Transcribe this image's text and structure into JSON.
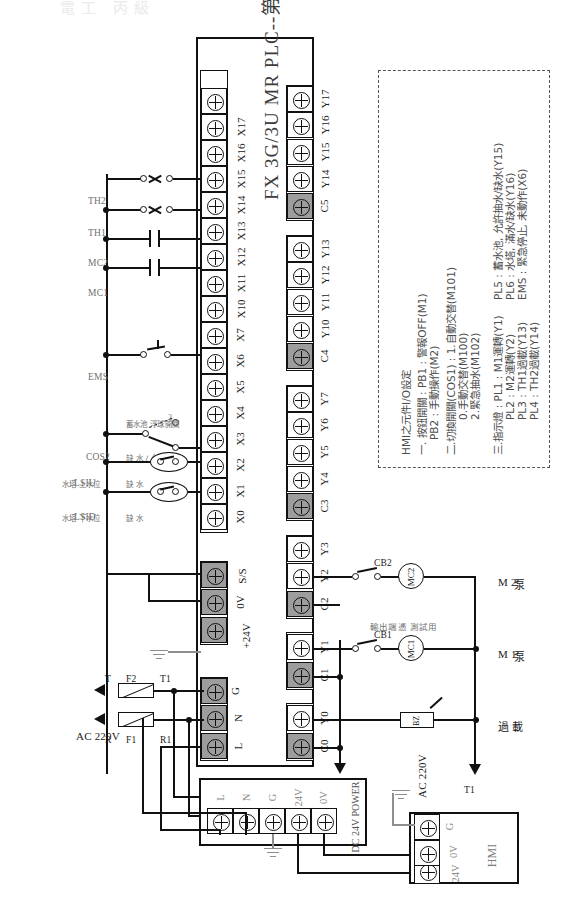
{
  "page": {
    "faint_header": "電工 丙級",
    "plc_title": "FX 3G/3U  MR  PLC--第二題"
  },
  "plc": {
    "input_terminal_labels": [
      "L",
      "N",
      "G",
      "+24V",
      "0V",
      "S/S",
      "X0",
      "X1",
      "X2",
      "X3",
      "X4",
      "X5",
      "X6",
      "X7",
      "X10",
      "X11",
      "X12",
      "X13",
      "X14",
      "X15",
      "X16",
      "X17"
    ],
    "output_terminal_labels": [
      "C0",
      "Y0",
      "C1",
      "Y1",
      "C2",
      "Y2",
      "Y3",
      "C3",
      "Y4",
      "Y5",
      "Y6",
      "Y7",
      "C4",
      "Y10",
      "Y11",
      "Y12",
      "Y13",
      "C5",
      "Y14",
      "Y15",
      "Y16",
      "Y17"
    ],
    "output_groups": [
      {
        "common": "C0",
        "outputs": [
          "Y0"
        ]
      },
      {
        "common": "C1",
        "outputs": [
          "Y1"
        ]
      },
      {
        "common": "C2",
        "outputs": [
          "Y2",
          "Y3"
        ]
      },
      {
        "common": "C3",
        "outputs": [
          "Y4",
          "Y5",
          "Y6",
          "Y7"
        ]
      },
      {
        "common": "C4",
        "outputs": [
          "Y10",
          "Y11",
          "Y12",
          "Y13"
        ]
      },
      {
        "common": "C5",
        "outputs": [
          "Y14",
          "Y15",
          "Y16",
          "Y17"
        ]
      }
    ]
  },
  "note_box": {
    "title": "HMI之元件I/O設定",
    "lines": [
      "一. 按鈕開關 : PB1 : 警報OFF(M1)",
      "PB2 : 手動操作(M2)",
      "二.切換開關(COS1) : 1.自動交替(M101)",
      "0.手動交替(M100)",
      "2.緊急抽水(M102)",
      "三.指示燈 :   PL1 : M1運轉(Y1)",
      "PL2 : M2運轉(Y2)",
      "PL3 : TH1過載(Y13)",
      "PL4 : TH2過載(Y14)",
      "PL5 : 蓄水池, 允許抽水/缺水(Y15)",
      "PL6 : 水塔, 滿水/缺水(Y16)",
      "EMS : 緊急停止, 未動作(X6)"
    ]
  },
  "inputs": {
    "devices": [
      {
        "name": "LSID",
        "desc_top": "水塔 下水位",
        "desc_bottom": "缺 水",
        "type": "float-switch"
      },
      {
        "name": "LSIU",
        "desc_top": "水塔 上水位",
        "desc_bottom": "缺 水",
        "type": "float-switch"
      },
      {
        "name": "COS2",
        "desc_top": "蓄水池 浮球開關",
        "desc_bottom": "缺 水 / 允許 抽水",
        "type": "selector",
        "positions": [
          "1",
          "2"
        ]
      },
      {
        "name": "EMS",
        "desc_top": "",
        "desc_bottom": "",
        "type": "emergency-stop"
      },
      {
        "name": "MC1",
        "desc_top": "",
        "desc_bottom": "",
        "type": "nc-contact"
      },
      {
        "name": "MC2",
        "desc_top": "",
        "desc_bottom": "",
        "type": "nc-contact"
      },
      {
        "name": "TH1",
        "desc_top": "",
        "desc_bottom": "",
        "type": "thermal-overload"
      },
      {
        "name": "TH2",
        "desc_top": "",
        "desc_bottom": "",
        "type": "thermal-overload"
      }
    ]
  },
  "power": {
    "ac_label": "AC 220V",
    "phase_r": "R",
    "phase_t": "T",
    "fuse_f1": "F1",
    "fuse_f2": "F2",
    "bus_r1": "R1",
    "bus_t1": "T1"
  },
  "outputs": {
    "test_note": "輸出端憑 測試用",
    "cb1": "CB1",
    "cb2": "CB2",
    "mc1": "MC1",
    "mc2": "MC2",
    "bz": "BZ",
    "m1_label": "M 1",
    "m1_sub": "泵",
    "m2_label": "M 2",
    "m2_sub": "泵",
    "overload_label": "過",
    "overload_sub": "載",
    "ac_source": "AC 220V",
    "bus_r1": "R1",
    "bus_t1": "T1"
  },
  "psu": {
    "title": "DC 24V POWER",
    "terminals": [
      "L",
      "N",
      "G",
      "24V",
      "0V"
    ]
  },
  "hmi": {
    "title": "HMI",
    "terminals": [
      "24V",
      "0V",
      "G"
    ]
  }
}
